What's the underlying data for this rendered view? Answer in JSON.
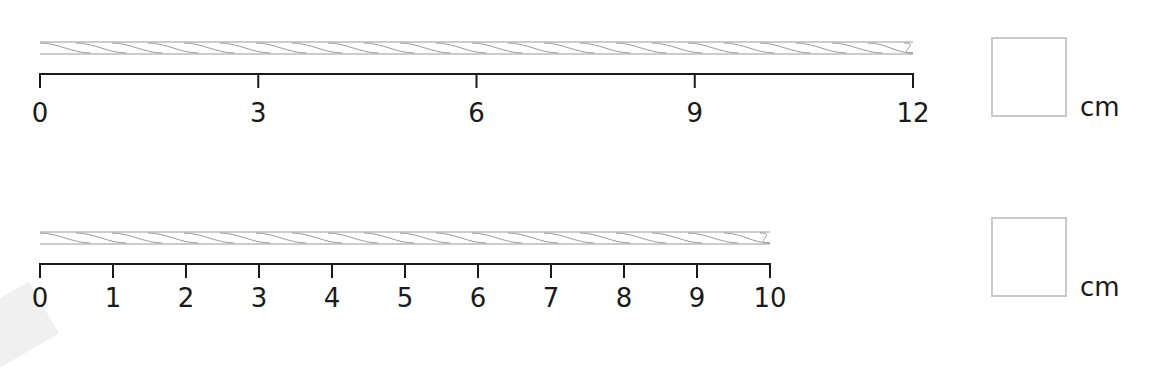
{
  "problems": [
    {
      "id": "rope-1",
      "rope": {
        "start": 0,
        "end": 12
      },
      "ruler": {
        "min": 0,
        "max": 12,
        "ticks": [
          0,
          3,
          6,
          9,
          12
        ],
        "labels": [
          "0",
          "3",
          "6",
          "9",
          "12"
        ]
      },
      "answer_box": {
        "value": "",
        "unit": "cm"
      }
    },
    {
      "id": "rope-2",
      "rope": {
        "start": 0,
        "end": 10
      },
      "ruler": {
        "min": 0,
        "max": 10,
        "ticks": [
          0,
          1,
          2,
          3,
          4,
          5,
          6,
          7,
          8,
          9,
          10
        ],
        "labels": [
          "0",
          "1",
          "2",
          "3",
          "4",
          "5",
          "6",
          "7",
          "8",
          "9",
          "10"
        ]
      },
      "answer_box": {
        "value": "",
        "unit": "cm"
      }
    }
  ],
  "colors": {
    "line": "#1a1a1a",
    "rope": "#9a9a9a",
    "box_border": "#c8c8c8"
  }
}
